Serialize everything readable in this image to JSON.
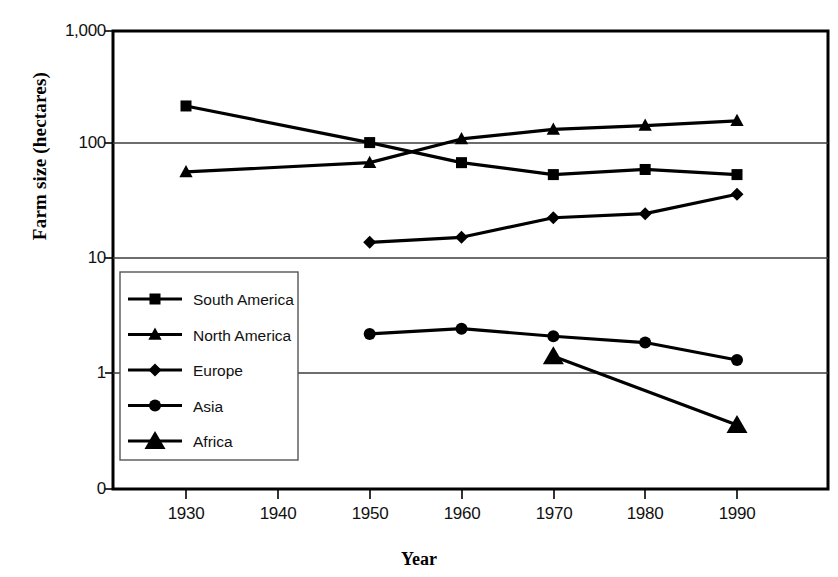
{
  "chart_data": {
    "type": "line",
    "title": "",
    "xlabel": "Year",
    "ylabel": "Farm size  (hectares)",
    "yscale": "log",
    "ylim": [
      1,
      1000
    ],
    "xlim": [
      1925,
      1995
    ],
    "grid": true,
    "legend_position": "inside-left",
    "x_ticks": [
      "1930",
      "1940",
      "1950",
      "1960",
      "1970",
      "1980",
      "1990"
    ],
    "y_ticks": [
      "1,000",
      "100",
      "10",
      "1",
      "0"
    ],
    "series": [
      {
        "name": "South America",
        "marker": "square",
        "x": [
          1930,
          1950,
          1960,
          1970,
          1980,
          1990
        ],
        "values": [
          220,
          105,
          70,
          55,
          61,
          55
        ]
      },
      {
        "name": "North America",
        "marker": "triangle-small",
        "x": [
          1930,
          1950,
          1960,
          1970,
          1980,
          1990
        ],
        "values": [
          58,
          70,
          113,
          137,
          148,
          163
        ]
      },
      {
        "name": "Europe",
        "marker": "diamond",
        "x": [
          1950,
          1960,
          1970,
          1980,
          1990
        ],
        "values": [
          14,
          15.5,
          23,
          25,
          37
        ]
      },
      {
        "name": "Asia",
        "marker": "circle",
        "x": [
          1950,
          1960,
          1970,
          1980,
          1990
        ],
        "values": [
          2.2,
          2.45,
          2.1,
          1.85,
          1.3
        ]
      },
      {
        "name": "Africa",
        "marker": "triangle-large",
        "x": [
          1970,
          1990
        ],
        "values": [
          1.4,
          0.35
        ]
      }
    ]
  },
  "legend": {
    "entries": [
      {
        "label": "South America"
      },
      {
        "label": "North America"
      },
      {
        "label": "Europe"
      },
      {
        "label": "Asia"
      },
      {
        "label": "Africa"
      }
    ]
  },
  "colors": {
    "ink": "#000000",
    "grid": "#4a4a4a",
    "background": "#ffffff"
  }
}
